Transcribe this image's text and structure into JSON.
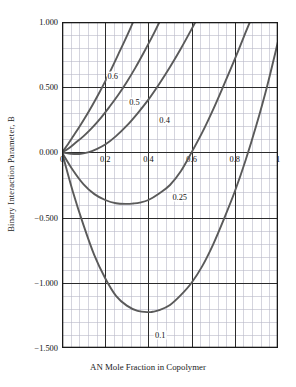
{
  "chart_data": {
    "type": "line",
    "title": "",
    "xlabel": "AN Mole Fraction in Copolymer",
    "ylabel": "Binary Interaction Parameter, B",
    "xlim": [
      0,
      1
    ],
    "ylim": [
      -1.5,
      1.0
    ],
    "grid": true,
    "grid_major_x": 0.2,
    "grid_major_y": 0.5,
    "grid_minor_x": 0.04,
    "grid_minor_y": 0.1,
    "legend_position": "inline-curve-labels",
    "xticks": [
      0,
      0.2,
      0.4,
      0.6,
      0.8,
      1
    ],
    "xticklabels": [
      "0",
      "0.2",
      "0.4",
      "0.6",
      "0.8",
      "1"
    ],
    "yticks": [
      1.0,
      0.5,
      0.0,
      -0.5,
      -1.0,
      -1.5
    ],
    "yticklabels": [
      "1.000",
      "0.500",
      "0.000",
      "−0.500",
      "−1.000",
      "−1.500"
    ],
    "curve_color": "#5a5a5a",
    "axis_color": "#1a1a1a",
    "grid_major_color": "#2b2b2b",
    "grid_minor_color": "#b9b9c8",
    "series": [
      {
        "name": "0.6",
        "label": "0.6",
        "label_x": 0.235,
        "label_y": 0.585,
        "x": [
          0.0,
          0.02,
          0.05,
          0.08,
          0.11,
          0.14,
          0.17,
          0.2,
          0.23,
          0.26,
          0.29,
          0.32,
          0.35,
          0.38,
          0.41
        ],
        "y": [
          0.0,
          0.045,
          0.12,
          0.195,
          0.275,
          0.36,
          0.45,
          0.545,
          0.645,
          0.75,
          0.855,
          0.965,
          1.08,
          1.2,
          1.33
        ]
      },
      {
        "name": "0.5",
        "label": "0.5",
        "label_x": 0.335,
        "label_y": 0.39,
        "x": [
          0.0,
          0.03,
          0.06,
          0.1,
          0.14,
          0.18,
          0.22,
          0.26,
          0.3,
          0.34,
          0.38,
          0.42,
          0.46,
          0.5
        ],
        "y": [
          0.0,
          0.03,
          0.07,
          0.125,
          0.19,
          0.265,
          0.35,
          0.44,
          0.54,
          0.65,
          0.77,
          0.895,
          1.03,
          1.17
        ]
      },
      {
        "name": "0.4",
        "label": "0.4",
        "label_x": 0.475,
        "label_y": 0.25,
        "x": [
          0.0,
          0.04,
          0.08,
          0.12,
          0.16,
          0.2,
          0.25,
          0.3,
          0.35,
          0.4,
          0.45,
          0.5,
          0.55,
          0.6,
          0.63
        ],
        "y": [
          0.0,
          -0.01,
          -0.012,
          0.0,
          0.025,
          0.06,
          0.125,
          0.205,
          0.3,
          0.405,
          0.525,
          0.655,
          0.795,
          0.945,
          1.04
        ]
      },
      {
        "name": "0.25",
        "label": "0.25",
        "label_x": 0.545,
        "label_y": -0.345,
        "x": [
          0.0,
          0.05,
          0.1,
          0.15,
          0.2,
          0.25,
          0.3,
          0.33,
          0.36,
          0.4,
          0.45,
          0.5,
          0.55,
          0.6,
          0.65,
          0.7,
          0.75,
          0.8,
          0.85,
          0.88
        ],
        "y": [
          0.0,
          -0.135,
          -0.245,
          -0.32,
          -0.365,
          -0.39,
          -0.395,
          -0.392,
          -0.385,
          -0.365,
          -0.315,
          -0.25,
          -0.145,
          0.0,
          0.155,
          0.33,
          0.52,
          0.715,
          0.92,
          1.04
        ]
      },
      {
        "name": "0.1",
        "label": "0.1",
        "label_x": 0.455,
        "label_y": -1.4,
        "x": [
          0.0,
          0.05,
          0.1,
          0.15,
          0.2,
          0.25,
          0.3,
          0.35,
          0.4,
          0.42,
          0.45,
          0.5,
          0.55,
          0.6,
          0.65,
          0.7,
          0.75,
          0.8,
          0.85,
          0.9,
          0.95,
          1.0
        ],
        "y": [
          0.0,
          -0.3,
          -0.56,
          -0.79,
          -0.965,
          -1.1,
          -1.175,
          -1.215,
          -1.225,
          -1.222,
          -1.21,
          -1.17,
          -1.095,
          -1.0,
          -0.87,
          -0.705,
          -0.51,
          -0.3,
          -0.06,
          0.21,
          0.51,
          0.85
        ]
      }
    ]
  }
}
